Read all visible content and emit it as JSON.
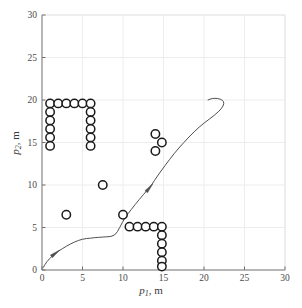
{
  "chart_data": {
    "type": "scatter",
    "title": "",
    "xlabel": "p1, m",
    "ylabel": "p2, m",
    "xlabel_base": "p",
    "xlabel_sub": "1",
    "xlabel_unit": ", m",
    "ylabel_base": "p",
    "ylabel_sub": "2",
    "ylabel_unit": ", m",
    "xlim": [
      0,
      30
    ],
    "ylim": [
      0,
      30
    ],
    "xticks": [
      0,
      5,
      10,
      15,
      20,
      25,
      30
    ],
    "yticks": [
      0,
      5,
      10,
      15,
      20,
      25,
      30
    ],
    "xticklabels": [
      "0",
      "5",
      "10",
      "15",
      "20",
      "25",
      "30"
    ],
    "yticklabels": [
      "0",
      "5",
      "10",
      "15",
      "20",
      "25",
      "30"
    ],
    "grid": true,
    "grid_color": "#ededed",
    "axis_color": "#6e6e6e",
    "legend": "none",
    "series": [
      {
        "name": "obstacles",
        "type": "scatter",
        "marker": "circle-open",
        "marker_color": "#1a1a1a",
        "marker_radius_data": 0.52,
        "points": [
          [
            1.0,
            19.6
          ],
          [
            2.0,
            19.6
          ],
          [
            3.0,
            19.6
          ],
          [
            4.0,
            19.6
          ],
          [
            5.0,
            19.6
          ],
          [
            6.0,
            19.6
          ],
          [
            1.0,
            18.6
          ],
          [
            1.0,
            17.6
          ],
          [
            1.0,
            16.6
          ],
          [
            1.0,
            15.6
          ],
          [
            1.0,
            14.6
          ],
          [
            6.0,
            18.6
          ],
          [
            6.0,
            17.6
          ],
          [
            6.0,
            16.6
          ],
          [
            6.0,
            15.6
          ],
          [
            6.0,
            14.6
          ],
          [
            3.0,
            6.5
          ],
          [
            7.5,
            10.0
          ],
          [
            10.0,
            6.5
          ],
          [
            14.0,
            16.0
          ],
          [
            14.8,
            15.0
          ],
          [
            14.0,
            14.0
          ],
          [
            10.8,
            5.1
          ],
          [
            11.8,
            5.1
          ],
          [
            12.8,
            5.1
          ],
          [
            13.8,
            5.1
          ],
          [
            14.8,
            5.1
          ],
          [
            14.8,
            4.1
          ],
          [
            14.8,
            3.1
          ],
          [
            14.8,
            2.1
          ],
          [
            14.8,
            1.1
          ],
          [
            14.8,
            0.4
          ]
        ]
      },
      {
        "name": "trajectory",
        "type": "line",
        "line_color": "#4f4f4f",
        "line_width": 1,
        "points": [
          [
            0.15,
            0.3
          ],
          [
            0.6,
            1.0
          ],
          [
            1.2,
            1.6
          ],
          [
            2.0,
            2.2
          ],
          [
            3.0,
            2.8
          ],
          [
            4.0,
            3.3
          ],
          [
            5.0,
            3.65
          ],
          [
            6.0,
            3.75
          ],
          [
            7.0,
            3.85
          ],
          [
            8.0,
            3.9
          ],
          [
            9.0,
            4.0
          ],
          [
            9.6,
            5.0
          ],
          [
            10.2,
            6.1
          ],
          [
            11.0,
            7.1
          ],
          [
            12.0,
            8.3
          ],
          [
            13.0,
            9.4
          ],
          [
            13.6,
            10.1
          ],
          [
            14.2,
            11.0
          ],
          [
            15.2,
            12.3
          ],
          [
            16.3,
            13.7
          ],
          [
            17.5,
            15.0
          ],
          [
            18.8,
            16.3
          ],
          [
            20.0,
            17.3
          ],
          [
            21.3,
            18.2
          ],
          [
            22.2,
            19.0
          ],
          [
            22.5,
            19.6
          ],
          [
            22.3,
            20.0
          ],
          [
            21.7,
            20.2
          ],
          [
            21.0,
            20.2
          ],
          [
            20.5,
            20.0
          ]
        ],
        "arrows": [
          {
            "x": 1.7,
            "y": 2.0,
            "angle": -38
          },
          {
            "x": 13.3,
            "y": 9.7,
            "angle": -50
          }
        ]
      }
    ]
  },
  "figure": {
    "width": 302,
    "height": 308,
    "background": "#ffffff",
    "plot_left": 42,
    "plot_right": 285,
    "plot_top": 15,
    "plot_bottom": 270
  }
}
